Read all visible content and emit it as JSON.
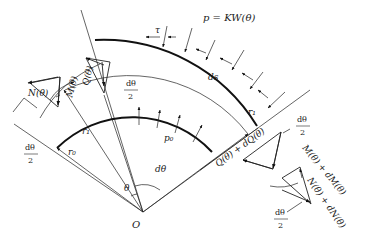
{
  "figure": {
    "type": "free-body diagram of curved beam element (tunnel lining segment)",
    "origin_label": "O",
    "angles": {
      "theta": "θ",
      "dtheta": "dθ",
      "half_dtheta_num": "dθ",
      "half_dtheta_den": "2"
    },
    "radii": {
      "outer": "r₁",
      "inner": "r₀"
    },
    "arc_length": "ds",
    "loads": {
      "outer_pressure": "p = KW(θ)",
      "inner_pressure": "p₀",
      "shear_traction": "τ"
    },
    "left_section_forces": {
      "axial": "N(θ)",
      "moment": "M(θ)",
      "shear": "Q(θ)"
    },
    "right_section_forces": {
      "axial": "N(θ) + dN(θ)",
      "moment": "M(θ) + dM(θ)",
      "shear": "Q(θ) + dQ(θ)"
    }
  }
}
